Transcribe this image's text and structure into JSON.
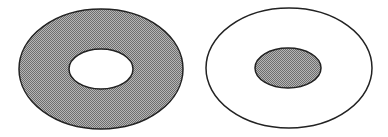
{
  "figure": {
    "colors": {
      "fill": "#8a8a8a",
      "stroke": "#222222",
      "background": "#ffffff"
    },
    "left": {
      "name": "shaded-annulus",
      "outer": {
        "cx": 101,
        "cy": 69,
        "rx": 82,
        "ry": 60
      },
      "inner": {
        "cx": 101,
        "cy": 69,
        "rx": 32,
        "ry": 20
      }
    },
    "right": {
      "name": "shaded-inner-disk",
      "outer": {
        "cx": 289,
        "cy": 68,
        "rx": 83,
        "ry": 60
      },
      "inner": {
        "cx": 288,
        "cy": 68,
        "rx": 33,
        "ry": 20
      }
    }
  }
}
